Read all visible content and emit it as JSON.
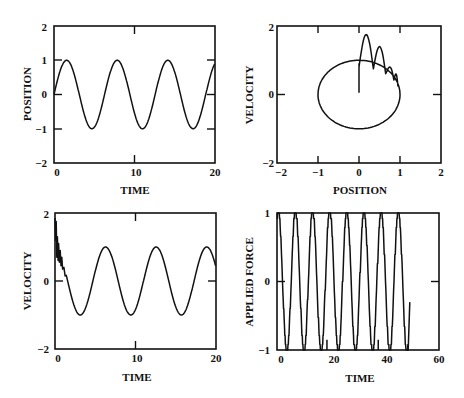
{
  "chart_data": [
    {
      "id": "position-vs-time",
      "type": "line",
      "title": "",
      "xlabel": "TIME",
      "ylabel": "POSITION",
      "xlim": [
        0,
        20
      ],
      "ylim": [
        -2,
        2
      ],
      "xticks": [
        "0",
        "10",
        "20"
      ],
      "yticks": [
        "2",
        "1",
        "0",
        "-1",
        "-2"
      ],
      "grid": false,
      "series": [
        {
          "name": "position",
          "formula": "sin(t)",
          "amplitude": 1.0,
          "period": 6.283,
          "x": [
            0,
            1.57,
            4.71,
            7.85,
            11.0,
            14.1,
            17.3,
            20
          ],
          "y": [
            0,
            1,
            -1,
            1,
            -1,
            1,
            -1,
            0.91
          ]
        }
      ]
    },
    {
      "id": "velocity-vs-position",
      "type": "line",
      "title": "",
      "xlabel": "POSITION",
      "ylabel": "VELOCITY",
      "xlim": [
        -2,
        2
      ],
      "ylim": [
        -2,
        2
      ],
      "xticks": [
        "-2",
        "-1",
        "0",
        "1",
        "2"
      ],
      "yticks": [
        "2",
        "0",
        "-2"
      ],
      "grid": false,
      "series": [
        {
          "name": "phase-trajectory",
          "description": "transient spikes from (0,0) decaying into unit limit cycle",
          "transient_peaks": [
            {
              "x": 0.1,
              "y": 1.75
            },
            {
              "x": 0.45,
              "y": 1.4
            },
            {
              "x": 0.75,
              "y": 0.8
            }
          ],
          "limit_cycle": {
            "center": [
              0,
              0
            ],
            "radius_x": 1.0,
            "radius_y": 1.0
          }
        }
      ]
    },
    {
      "id": "velocity-vs-time",
      "type": "line",
      "title": "",
      "xlabel": "TIME",
      "ylabel": "VELOCITY",
      "xlim": [
        0,
        20
      ],
      "ylim": [
        -2,
        2
      ],
      "xticks": [
        "0",
        "10",
        "20"
      ],
      "yticks": [
        "2",
        "0",
        "-2"
      ],
      "grid": false,
      "series": [
        {
          "name": "velocity",
          "description": "noisy transient near t=0 (peak ~1.8) then cos-like oscillation amplitude 1",
          "x": [
            0,
            0.3,
            0.6,
            1.0,
            3.0,
            6.3,
            9.4,
            12.5,
            15.7,
            18.8,
            20
          ],
          "y": [
            1.8,
            1.3,
            0.9,
            0.3,
            -1,
            1,
            -1,
            1,
            -1,
            1,
            0.5
          ]
        }
      ]
    },
    {
      "id": "applied-force-vs-time",
      "type": "line",
      "title": "",
      "xlabel": "TIME",
      "ylabel": "APPLIED FORCE",
      "xlim": [
        0,
        60
      ],
      "ylim": [
        -1,
        1
      ],
      "xticks": [
        "0",
        "20",
        "40",
        "60"
      ],
      "yticks": [
        "1",
        "0",
        "-1"
      ],
      "grid": false,
      "series": [
        {
          "name": "applied-force",
          "description": "stepped/quantized oscillation between -1 and 1, ~8 cycles, ends near t=49 at -0.3",
          "peaks_x": [
            0.5,
            7,
            13,
            19.5,
            26,
            32.5,
            38.5,
            45
          ],
          "troughs_x": [
            4,
            10,
            16.5,
            23,
            29.5,
            35.5,
            42,
            48
          ],
          "end": {
            "x": 49,
            "y": -0.3
          }
        }
      ]
    }
  ],
  "plots": {
    "tl": {
      "xlabel": "TIME",
      "ylabel": "POSITION",
      "xt": [
        "0",
        "10",
        "20"
      ],
      "yt": [
        "2",
        "1",
        "0",
        "-1",
        "-2"
      ]
    },
    "tr": {
      "xlabel": "POSITION",
      "ylabel": "VELOCITY",
      "xt": [
        "-2",
        "-1",
        "0",
        "1",
        "2"
      ],
      "yt": [
        "2",
        "0",
        "-2"
      ]
    },
    "bl": {
      "xlabel": "TIME",
      "ylabel": "VELOCITY",
      "xt": [
        "0",
        "10",
        "20"
      ],
      "yt": [
        "2",
        "0",
        "-2"
      ]
    },
    "br": {
      "xlabel": "TIME",
      "ylabel": "APPLIED FORCE",
      "xt": [
        "0",
        "20",
        "40",
        "60"
      ],
      "yt": [
        "1",
        "0",
        "-1"
      ]
    }
  }
}
